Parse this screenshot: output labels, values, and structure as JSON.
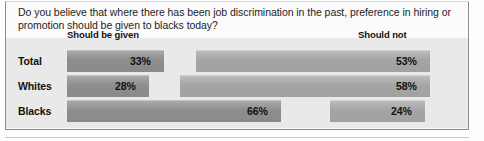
{
  "figure": {
    "question": "Do you believe that where there has been job discrimination in the past, preference in hiring or promotion should be given to blacks today?"
  },
  "chart_data": {
    "type": "bar",
    "title": "Do you believe that where there has been job discrimination in the past, preference in hiring or promotion should be given to blacks today?",
    "orientation": "horizontal",
    "stacked": true,
    "xlabel": "",
    "ylabel": "",
    "xlim": [
      0,
      100
    ],
    "grid": false,
    "legend_position": "top",
    "categories": [
      "Total",
      "Whites",
      "Blacks"
    ],
    "series": [
      {
        "name": "Should be given",
        "values": [
          33,
          28,
          66
        ],
        "labels": [
          "33%",
          "28%",
          "66%"
        ],
        "color": "#8e8e8e"
      },
      {
        "name": "Should not",
        "values": [
          53,
          58,
          24
        ],
        "labels": [
          "53%",
          "58%",
          "24%"
        ],
        "color": "#a5a5a5"
      }
    ],
    "column_headers": [
      "Should be given",
      "Should not"
    ]
  },
  "rows": [
    {
      "label": "Total",
      "given_label": "33%",
      "not_label": "53%",
      "given_px": 97,
      "not_start_px": 196,
      "not_px": 234
    },
    {
      "label": "Whites",
      "given_label": "28%",
      "not_label": "58%",
      "given_px": 82,
      "not_start_px": 180,
      "not_px": 250
    },
    {
      "label": "Blacks",
      "given_label": "66%",
      "not_label": "24%",
      "given_px": 214,
      "not_start_px": 330,
      "not_px": 95
    }
  ],
  "colors": {
    "bar_given": "#8e8e8e",
    "bar_not": "#a5a5a5",
    "panel": "#e9e9e9",
    "frame": "#8d8d8d",
    "text": "#111111"
  }
}
